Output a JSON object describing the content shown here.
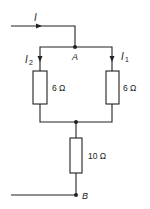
{
  "diagram": {
    "type": "circuit",
    "nodes": {
      "A": "A",
      "B": "B"
    },
    "currents": {
      "total": "I",
      "branch_left": "2",
      "branch_right": "1",
      "symbol": "I"
    },
    "resistors": [
      {
        "id": "left",
        "value": "6 Ω"
      },
      {
        "id": "right",
        "value": "6 Ω"
      },
      {
        "id": "series",
        "value": "10 Ω"
      }
    ],
    "colors": {
      "wire": "#222222",
      "background": "#ffffff"
    }
  }
}
